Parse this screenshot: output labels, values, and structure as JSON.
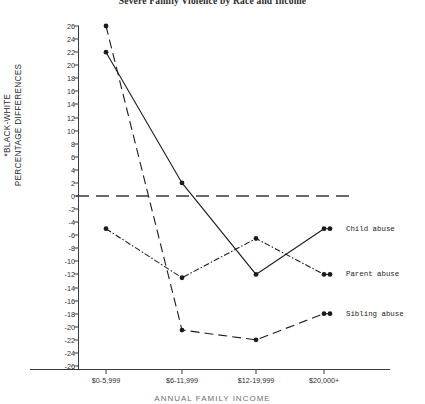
{
  "chart_data": {
    "type": "line",
    "title": "Severe Family Violence by Race and Income",
    "xlabel": "ANNUAL FAMILY INCOME",
    "ylabel_line1": "*BLACK-WHITE",
    "ylabel_line2": "PERCENTAGE DIFFERENCES",
    "categories": [
      "$0-5,999",
      "$6-11,999",
      "$12-19,999",
      "$20,000+"
    ],
    "ylim": [
      -26,
      26
    ],
    "ytick_step": 2,
    "yticks": [
      "26",
      "24",
      "22",
      "20",
      "18",
      "16",
      "14",
      "12",
      "10",
      "8",
      "6",
      "4",
      "2",
      "0",
      "-2",
      "-4",
      "-6",
      "-8",
      "-10",
      "-12",
      "-14",
      "-16",
      "-18",
      "-20",
      "-22",
      "-24",
      "-26"
    ],
    "grid": false,
    "legend_position": "right-inline",
    "zero_reference_line": 0,
    "series": [
      {
        "name": "Child abuse",
        "values": [
          22,
          2,
          -12,
          -5
        ],
        "linestyle": "solid",
        "color": "#1c1c1c"
      },
      {
        "name": "Parent abuse",
        "values": [
          -5,
          -12.5,
          -6.5,
          -12
        ],
        "linestyle": "dash-dot",
        "color": "#1c1c1c"
      },
      {
        "name": "Sibling abuse",
        "values": [
          26,
          -20.5,
          -22,
          -18
        ],
        "linestyle": "long-dash",
        "color": "#1c1c1c"
      }
    ]
  },
  "legend": {
    "child": "Child abuse",
    "parent": "Parent abuse",
    "sibling": "Sibling abuse"
  },
  "axis": {
    "x_title": "ANNUAL FAMILY INCOME"
  }
}
